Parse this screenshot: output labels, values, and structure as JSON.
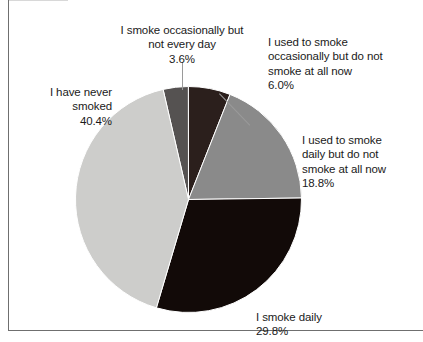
{
  "chart_data": {
    "type": "pie",
    "title": "",
    "subtitle": "",
    "xlabel": "",
    "ylabel": "",
    "legend_position": "none",
    "grid": false,
    "units": "percent",
    "total": 100.6,
    "categories": [
      "I smoke occasionally but not every day",
      "I used to smoke occasionally but do not smoke at all now",
      "I used to smoke daily but do not smoke at all now",
      "I smoke daily",
      "I have never smoked"
    ],
    "values": [
      3.6,
      6.0,
      18.8,
      29.8,
      40.4
    ],
    "value_labels": [
      "3.6%",
      "6.0%",
      "18.8%",
      "29.8%",
      "40.4%"
    ],
    "colors": [
      "#555251",
      "#2b1f1c",
      "#8a8a8a",
      "#120a08",
      "#cdcdcb"
    ],
    "slices": [
      {
        "name": "occasional-not-daily",
        "label": "I smoke occasionally but\nnot every day",
        "value_label": "3.6%",
        "value": 3.6,
        "color": "#555251",
        "start_angle": -13.0,
        "end_angle": -0.04
      },
      {
        "name": "used-occasionally",
        "label": "I used to smoke\noccasionally but do not\nsmoke at all now",
        "value_label": "6.0%",
        "value": 6.0,
        "color": "#2b1f1c",
        "start_angle": -0.04,
        "end_angle": 21.56
      },
      {
        "name": "used-daily",
        "label": "I used to smoke\ndaily but do not\nsmoke at all now",
        "value_label": "18.8%",
        "value": 18.8,
        "color": "#8a8a8a",
        "start_angle": 21.56,
        "end_angle": 89.24
      },
      {
        "name": "smoke-daily",
        "label": "I smoke daily",
        "value_label": "29.8%",
        "value": 29.8,
        "color": "#120a08",
        "start_angle": 89.24,
        "end_angle": 196.52
      },
      {
        "name": "never-smoked",
        "label": "I have never\nsmoked",
        "value_label": "40.4%",
        "value": 40.4,
        "color": "#cdcdcb",
        "start_angle": 196.52,
        "end_angle": 347.0
      }
    ],
    "geometry": {
      "center_x": 113.5,
      "center_y": 113.5,
      "radius": 113,
      "stroke_color": "#ffffff"
    }
  },
  "labels": {
    "occasional_not_daily": {
      "text": "I smoke occasionally but\nnot every day",
      "percent": "3.6%"
    },
    "used_occasionally": {
      "text": "I used to smoke\noccasionally but do not\nsmoke at all now",
      "percent": "6.0%"
    },
    "used_daily": {
      "text": "I used to smoke\ndaily but do not\nsmoke at all now",
      "percent": "18.8%"
    },
    "smoke_daily": {
      "text": "I smoke daily",
      "percent": "29.8%"
    },
    "never_smoked": {
      "text": "I have never\nsmoked",
      "percent": "40.4%"
    }
  }
}
